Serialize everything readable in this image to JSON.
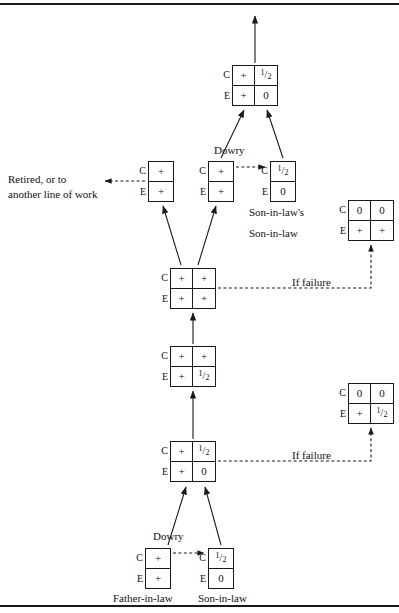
{
  "figure": {
    "line_color": "#1a1a1a"
  },
  "labels": {
    "row_c": "C",
    "row_e": "E",
    "dowry": "Dowry",
    "if_failure": "If failure",
    "retired_line1": "Retired, or to",
    "retired_line2": "another line of work",
    "sons_son_line1": "Son-in-law's",
    "sons_son_line2": "Son-in-law",
    "father_in_law": "Father-in-law",
    "son_in_law": "Son-in-law"
  },
  "boxes": [
    {
      "id": "top-outcome",
      "name": "matrix-top-outcome",
      "cols": 2,
      "x": 232,
      "y": 65,
      "c": [
        "+",
        "1/2"
      ],
      "e": [
        "+",
        "0"
      ]
    },
    {
      "id": "retired-state",
      "name": "matrix-retired-state",
      "cols": 1,
      "x": 148,
      "y": 161,
      "c": [
        "+"
      ],
      "e": [
        "+"
      ]
    },
    {
      "id": "dowry-giver-mid",
      "name": "matrix-dowry-giver-mid",
      "cols": 1,
      "x": 208,
      "y": 161,
      "c": [
        "+"
      ],
      "e": [
        "+"
      ]
    },
    {
      "id": "sons-son-in-law",
      "name": "matrix-sons-son-in-law",
      "cols": 1,
      "x": 270,
      "y": 161,
      "c": [
        "1/2"
      ],
      "e": [
        "0"
      ]
    },
    {
      "id": "mature-household",
      "name": "matrix-mature-household",
      "cols": 2,
      "x": 170,
      "y": 268,
      "c": [
        "+",
        "+"
      ],
      "e": [
        "+",
        "+"
      ]
    },
    {
      "id": "growing-household",
      "name": "matrix-growing-household",
      "cols": 2,
      "x": 170,
      "y": 346,
      "c": [
        "+",
        "+"
      ],
      "e": [
        "+",
        "1/2"
      ]
    },
    {
      "id": "early-household",
      "name": "matrix-early-household",
      "cols": 2,
      "x": 170,
      "y": 441,
      "c": [
        "+",
        "1/2"
      ],
      "e": [
        "+",
        "0"
      ]
    },
    {
      "id": "failure-upper",
      "name": "matrix-failure-upper",
      "cols": 2,
      "x": 348,
      "y": 200,
      "c": [
        "0",
        "0"
      ],
      "e": [
        "+",
        "+"
      ]
    },
    {
      "id": "failure-lower",
      "name": "matrix-failure-lower",
      "cols": 2,
      "x": 348,
      "y": 383,
      "c": [
        "0",
        "0"
      ],
      "e": [
        "+",
        "1/2"
      ]
    },
    {
      "id": "father-in-law",
      "name": "matrix-father-in-law",
      "cols": 1,
      "x": 145,
      "y": 548,
      "c": [
        "+"
      ],
      "e": [
        "+"
      ]
    },
    {
      "id": "son-in-law",
      "name": "matrix-son-in-law",
      "cols": 1,
      "x": 208,
      "y": 548,
      "c": [
        "1/2"
      ],
      "e": [
        "0"
      ]
    }
  ]
}
